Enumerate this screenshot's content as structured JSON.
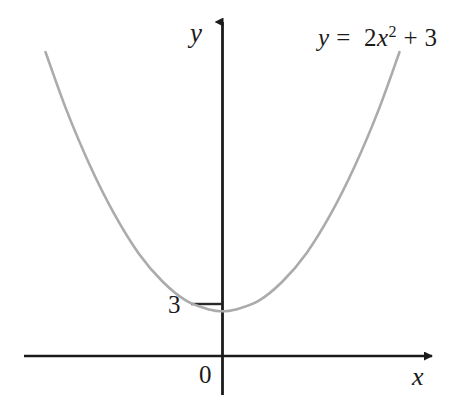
{
  "figure": {
    "background_color": "#ffffff",
    "width": 472,
    "height": 395
  },
  "axes": {
    "x_label": "x",
    "y_label": "y",
    "origin_label": "0",
    "axis_color": "#1b1b1b"
  },
  "ticks": {
    "y_intercept_label": "3"
  },
  "equation": {
    "lhs": "y",
    "equals": "=",
    "coefficient": "2",
    "variable": "x",
    "exponent": "2",
    "plus": "+",
    "constant": "3",
    "full_text": "y = 2x2 + 3"
  },
  "chart_data": {
    "type": "line",
    "title": "",
    "subtitle": "",
    "xlabel": "x",
    "ylabel": "y",
    "annotations": [
      "y = 2x² + 3"
    ],
    "legend": [],
    "legend_position": "none",
    "grid": false,
    "axis_style": "arrow-tipped cartesian axes through origin",
    "xlim": [
      -3.3,
      3.3
    ],
    "ylim": [
      -1.2,
      21
    ],
    "xticks": [
      0
    ],
    "xticklabels": [
      "0"
    ],
    "yticks": [
      3
    ],
    "yticklabels": [
      "3"
    ],
    "series": [
      {
        "name": "y = 2x^2 + 3",
        "color": "#ababab",
        "linewidth": 2,
        "formula": "y = 2*x^2 + 3",
        "vertex": [
          0,
          3
        ],
        "x": [
          -2.95,
          -2.6,
          -2.2,
          -1.8,
          -1.4,
          -1.0,
          -0.6,
          -0.2,
          0,
          0.2,
          0.6,
          1.0,
          1.4,
          1.8,
          2.2,
          2.6,
          2.95
        ],
        "y": [
          20.4,
          16.5,
          12.7,
          9.5,
          6.9,
          5.0,
          3.7,
          3.1,
          3.0,
          3.1,
          3.7,
          5.0,
          6.9,
          9.5,
          12.7,
          16.5,
          20.4
        ]
      }
    ]
  }
}
